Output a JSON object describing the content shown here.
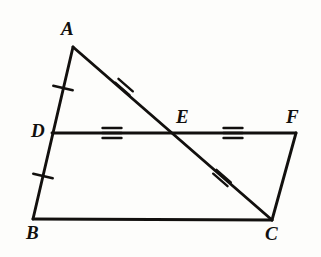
{
  "figure": {
    "background_color": "#fdfdfb",
    "stroke_color": "#12100e",
    "canvas": {
      "width": 321,
      "height": 257
    }
  },
  "points": {
    "A": {
      "label": "A",
      "x": 73,
      "y": 47
    },
    "B": {
      "label": "B",
      "x": 33,
      "y": 219
    },
    "C": {
      "label": "C",
      "x": 272,
      "y": 220
    },
    "D": {
      "label": "D",
      "x": 52,
      "y": 133
    },
    "E": {
      "label": "E",
      "x": 175,
      "y": 132
    },
    "F": {
      "label": "F",
      "x": 296,
      "y": 133
    }
  },
  "segments": [
    {
      "name": "AB",
      "from": "A",
      "to": "B",
      "x1": 73,
      "y1": 47,
      "x2": 33,
      "y2": 219
    },
    {
      "name": "BC",
      "from": "B",
      "to": "C",
      "x1": 33,
      "y1": 219,
      "x2": 272,
      "y2": 220
    },
    {
      "name": "AC",
      "from": "A",
      "to": "C",
      "x1": 73,
      "y1": 47,
      "x2": 272,
      "y2": 220
    },
    {
      "name": "DF",
      "from": "D",
      "to": "F",
      "x1": 52,
      "y1": 133,
      "x2": 296,
      "y2": 133
    },
    {
      "name": "FC",
      "from": "F",
      "to": "C",
      "x1": 296,
      "y1": 133,
      "x2": 272,
      "y2": 220
    }
  ],
  "tick_marks": [
    {
      "name": "tick-AD",
      "segment": "AD",
      "count": 1,
      "x": 63,
      "y": 88,
      "angle": 103
    },
    {
      "name": "tick-DB",
      "segment": "DB",
      "count": 1,
      "x": 43,
      "y": 176,
      "angle": 103
    },
    {
      "name": "tick-AE",
      "segment": "AE",
      "count": 2,
      "x": 124,
      "y": 87,
      "angle": 131
    },
    {
      "name": "tick-EC",
      "segment": "EC",
      "count": 2,
      "x": 222,
      "y": 178,
      "angle": 131
    },
    {
      "name": "tick-DE",
      "segment": "DE",
      "count": 3,
      "x": 112,
      "y": 133,
      "angle": 90
    },
    {
      "name": "tick-EF",
      "segment": "EF",
      "count": 3,
      "x": 233,
      "y": 133,
      "angle": 90
    }
  ],
  "chart_data": {
    "type": "diagram",
    "vertices": [
      "A",
      "B",
      "C",
      "D",
      "E",
      "F"
    ],
    "edges": [
      "AB",
      "BC",
      "AC",
      "DF",
      "FC"
    ],
    "congruence_groups": [
      {
        "ticks": 1,
        "segments": [
          "AD",
          "DB"
        ]
      },
      {
        "ticks": 2,
        "segments": [
          "AE",
          "EC"
        ]
      },
      {
        "ticks": 3,
        "segments": [
          "DE",
          "EF"
        ]
      }
    ]
  }
}
